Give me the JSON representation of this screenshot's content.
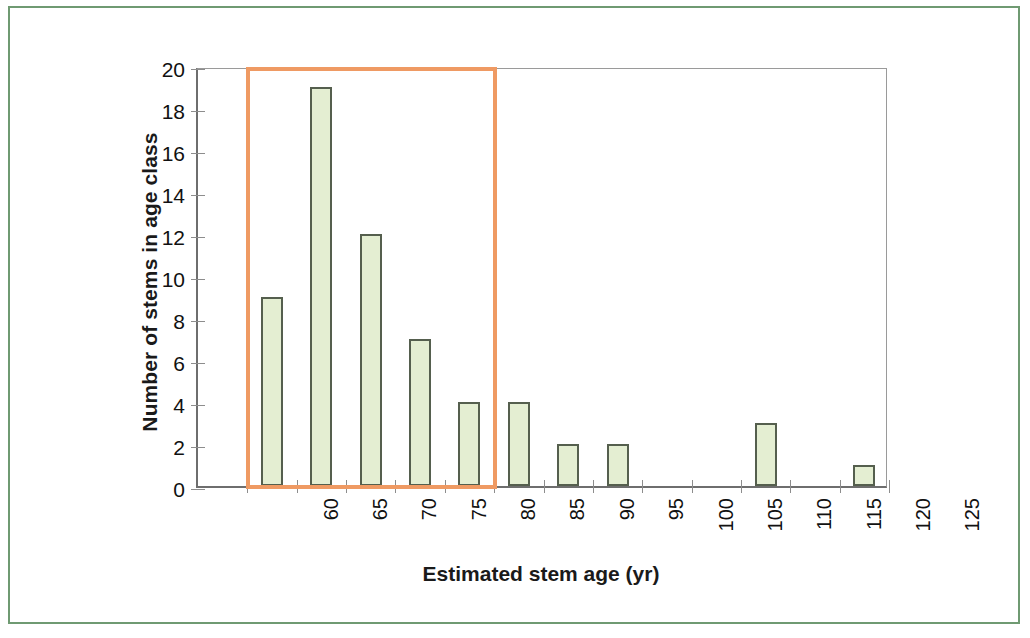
{
  "chart_data": {
    "type": "bar",
    "title": "",
    "subtitle": "",
    "xlabel": "Estimated stem age (yr)",
    "ylabel": "Number of stems in age class",
    "categories": [
      "60",
      "65",
      "70",
      "75",
      "80",
      "85",
      "90",
      "95",
      "100",
      "105",
      "110",
      "115",
      "120",
      "125"
    ],
    "values": [
      0,
      9,
      19,
      12,
      7,
      4,
      4,
      2,
      2,
      0,
      0,
      3,
      0,
      1
    ],
    "xlim": [
      "60",
      "125"
    ],
    "ylim": [
      0,
      20
    ],
    "y_ticks": [
      0,
      2,
      4,
      6,
      8,
      10,
      12,
      14,
      16,
      18,
      20
    ],
    "y_tick_labels": [
      "0",
      "2",
      "4",
      "6",
      "8",
      "10",
      "12",
      "14",
      "16",
      "18",
      "20"
    ],
    "x_tick_labels": [
      "60",
      "65",
      "70",
      "75",
      "80",
      "85",
      "90",
      "95",
      "100",
      "105",
      "110",
      "115",
      "120",
      "125"
    ],
    "grid": false,
    "legend": null,
    "legend_position": "none",
    "bar_fill_color": "#e4eed2",
    "bar_border_color": "#555f4e",
    "x_label_rotation": -90,
    "y_label_rotation": -90,
    "annotations": [
      {
        "name": "age-class-highlight-box",
        "type": "rectangle",
        "color": "#ef9a63",
        "x_range": [
          "62",
          "87"
        ],
        "y_range": [
          0,
          20
        ],
        "label": ""
      }
    ]
  },
  "figure": {
    "frame_color": "#6f9a72",
    "background_color": "#ffffff",
    "axis_color": "#6e6e6e"
  }
}
